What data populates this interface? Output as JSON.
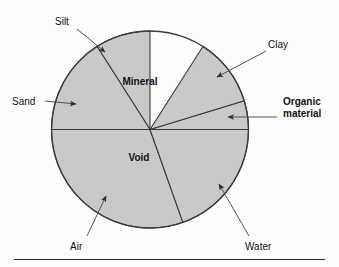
{
  "figure": {
    "type": "pie-diagram",
    "background_color": "#fdfdfd",
    "slice_fill": "#c9c9c9",
    "slice_stroke": "#3a3a3a",
    "leader_line_color": "#4a4a4a",
    "text_color": "#111111"
  },
  "chart_data": {
    "type": "pie",
    "center": {
      "x": 150,
      "y": 129.5
    },
    "radius": 98.5,
    "grid": false,
    "legend": "none",
    "categories": [
      "Silt",
      "Sand",
      "Air",
      "Water",
      "Organic material",
      "Clay"
    ],
    "slices": [
      {
        "name": "Silt",
        "start_deg": 237.5,
        "end_deg": 270.0,
        "label_in_slice": null
      },
      {
        "name": "Sand",
        "start_deg": 180.0,
        "end_deg": 237.5,
        "label_in_slice": null
      },
      {
        "name": "Air",
        "start_deg": 70.5,
        "end_deg": 180.0,
        "label_in_slice": "Void"
      },
      {
        "name": "Water",
        "start_deg": 0.0,
        "end_deg": 70.5,
        "label_in_slice": null
      },
      {
        "name": "Organic material",
        "start_deg": 343.0,
        "end_deg": 360.0,
        "label_in_slice": null
      },
      {
        "name": "Clay",
        "start_deg": 302.5,
        "end_deg": 343.0,
        "label_in_slice": null
      }
    ],
    "group_labels": [
      {
        "text": "Mineral",
        "x": 140,
        "y": 82
      },
      {
        "text": "Void",
        "x": 139,
        "y": 158
      }
    ]
  },
  "slice_labels": {
    "mineral": "Mineral",
    "void": "Void"
  },
  "callouts": [
    {
      "id": "silt",
      "text": "Silt",
      "bold": false,
      "label_x": 55,
      "label_y": 16,
      "line": {
        "x1": 77,
        "y1": 29,
        "x2": 105,
        "y2": 52
      },
      "arrow_at": {
        "x": 106,
        "y": 53
      }
    },
    {
      "id": "sand",
      "text": "Sand",
      "bold": false,
      "label_x": 12,
      "label_y": 96,
      "line": {
        "x1": 45,
        "y1": 101,
        "x2": 76,
        "y2": 104
      },
      "arrow_at": {
        "x": 78,
        "y": 104
      }
    },
    {
      "id": "air",
      "text": "Air",
      "bold": false,
      "label_x": 70,
      "label_y": 241,
      "line": {
        "x1": 87,
        "y1": 236,
        "x2": 106,
        "y2": 196
      },
      "arrow_at": {
        "x": 107,
        "y": 194
      }
    },
    {
      "id": "water",
      "text": "Water",
      "bold": false,
      "label_x": 245,
      "label_y": 241,
      "line": {
        "x1": 249,
        "y1": 236,
        "x2": 219,
        "y2": 184
      },
      "arrow_at": {
        "x": 218,
        "y": 182
      }
    },
    {
      "id": "organic-material",
      "text": "Organic\nmaterial",
      "bold": true,
      "label_x": 283,
      "label_y": 96,
      "line": {
        "x1": 277,
        "y1": 117,
        "x2": 228,
        "y2": 117
      },
      "arrow_at": {
        "x": 226,
        "y": 117
      }
    },
    {
      "id": "clay",
      "text": "Clay",
      "bold": false,
      "label_x": 268,
      "label_y": 39,
      "line": {
        "x1": 266,
        "y1": 51,
        "x2": 217,
        "y2": 77
      },
      "arrow_at": {
        "x": 215,
        "y": 78
      }
    }
  ],
  "footer": {
    "rule": true
  }
}
